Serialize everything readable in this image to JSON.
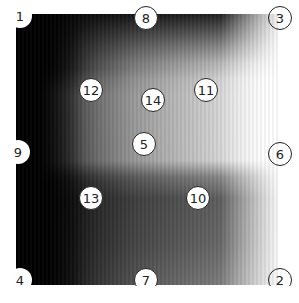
{
  "figure": {
    "type": "grayscale-heatmap",
    "colormap": "gray",
    "colors": {
      "dark": "#000000",
      "light": "#ffffff",
      "marker_fill": "#ffffff",
      "marker_stroke": "#222222"
    }
  },
  "markers": [
    {
      "label": "1",
      "x": 20,
      "y": 16
    },
    {
      "label": "8",
      "x": 146,
      "y": 18
    },
    {
      "label": "3",
      "x": 280,
      "y": 18
    },
    {
      "label": "12",
      "x": 91,
      "y": 90
    },
    {
      "label": "14",
      "x": 153,
      "y": 100
    },
    {
      "label": "11",
      "x": 206,
      "y": 90
    },
    {
      "label": "5",
      "x": 144,
      "y": 144
    },
    {
      "label": "9",
      "x": 18,
      "y": 152
    },
    {
      "label": "6",
      "x": 280,
      "y": 154
    },
    {
      "label": "13",
      "x": 91,
      "y": 198
    },
    {
      "label": "10",
      "x": 198,
      "y": 198
    },
    {
      "label": "4",
      "x": 20,
      "y": 280
    },
    {
      "label": "7",
      "x": 146,
      "y": 280
    },
    {
      "label": "2",
      "x": 280,
      "y": 280
    }
  ]
}
